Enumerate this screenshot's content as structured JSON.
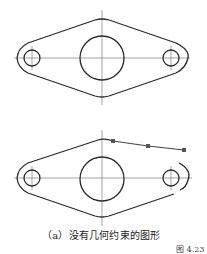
{
  "figure": {
    "caption": "（a）没有几何约束的图形",
    "figure_number": "图 4.23",
    "top_drawing": {
      "label": "reference-shape",
      "center_circle": {
        "cx": 102,
        "cy": 58,
        "r": 22
      },
      "left_hole": {
        "cx": 32,
        "cy": 58,
        "r": 8
      },
      "right_hole": {
        "cx": 171,
        "cy": 58,
        "r": 8
      }
    },
    "bottom_drawing": {
      "label": "shape-without-constraints",
      "center_circle": {
        "cx": 102,
        "cy": 179,
        "r": 22
      },
      "left_hole": {
        "cx": 32,
        "cy": 178,
        "r": 8
      },
      "right_hole": {
        "cx": 171,
        "cy": 178,
        "r": 8
      },
      "grip_points": [
        {
          "x": 113,
          "y": 141
        },
        {
          "x": 148,
          "y": 146
        },
        {
          "x": 184,
          "y": 150
        }
      ]
    },
    "colors": {
      "line": "#2a2a2a",
      "centerline": "#555555",
      "grip": "#555555"
    }
  }
}
